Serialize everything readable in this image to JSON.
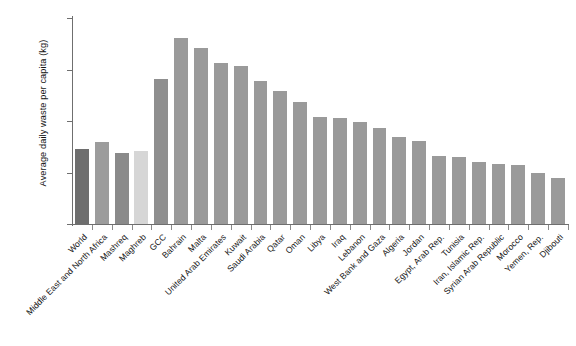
{
  "chart_data": {
    "type": "bar",
    "title": "",
    "xlabel": "",
    "ylabel": "Average daily waste per capita (kg)",
    "ylim": [
      0,
      2.0
    ],
    "ytick_labels": [
      "0",
      "0.5",
      "1.0",
      "1.5",
      "2.0"
    ],
    "ytick_values": [
      0,
      0.5,
      1.0,
      1.5,
      2.0
    ],
    "grid": false,
    "legend": "none",
    "categories": [
      "World",
      "Middle East and North Africa",
      "Mashreq",
      "Maghreb",
      "GCC",
      "Bahrain",
      "Malta",
      "United Arab Emirates",
      "Kuwait",
      "Saudi Arabia",
      "Qatar",
      "Oman",
      "Libya",
      "Iraq",
      "Lebanon",
      "West Bank and Gaza",
      "Algeria",
      "Jordan",
      "Egypt, Arab Rep.",
      "Tunisia",
      "Iran, Islamic Rep.",
      "Syrian Arab Republic",
      "Morocco",
      "Yemen, Rep.",
      "Djibouti"
    ],
    "values": [
      0.73,
      0.8,
      0.69,
      0.71,
      1.41,
      1.81,
      1.71,
      1.56,
      1.53,
      1.39,
      1.29,
      1.18,
      1.04,
      1.03,
      0.99,
      0.93,
      0.84,
      0.81,
      0.66,
      0.65,
      0.6,
      0.58,
      0.57,
      0.5,
      0.45
    ],
    "bar_colors": [
      "#6e6e6e",
      "#9c9c9c",
      "#8a8a8a",
      "#d6d6d6",
      "#8f8f8f",
      "#9a9a9a",
      "#9a9a9a",
      "#9a9a9a",
      "#9a9a9a",
      "#9a9a9a",
      "#9a9a9a",
      "#9a9a9a",
      "#9a9a9a",
      "#9a9a9a",
      "#9a9a9a",
      "#9a9a9a",
      "#9a9a9a",
      "#9a9a9a",
      "#9a9a9a",
      "#9a9a9a",
      "#9a9a9a",
      "#9a9a9a",
      "#9a9a9a",
      "#9a9a9a",
      "#9a9a9a"
    ]
  }
}
